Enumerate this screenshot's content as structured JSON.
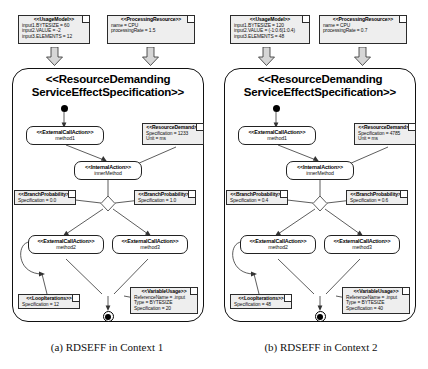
{
  "figure": {
    "captions": {
      "left": "(a) RDSEFF in Context 1",
      "right": "(b) RDSEFF in Context 2"
    }
  },
  "icons": {
    "down_arrow": "down-arrow-icon",
    "note_fold": "note-fold-icon",
    "start_node": "start-node-icon",
    "stop_node": "stop-node-icon",
    "decision_diamond": "decision-diamond-icon"
  },
  "panels": [
    {
      "id": "context-1",
      "usage_model": {
        "stereotype": "<<UsageModel>>",
        "lines": [
          "input1.BYTESIZE = 60",
          "input2.VALUE = -2",
          "input3.ELEMENTS = 12"
        ]
      },
      "processing_resource": {
        "stereotype": "<<ProcessingResource>>",
        "lines": [
          "name = CPU",
          "processingRate = 1.5"
        ]
      },
      "rdseff": {
        "title_line1": "<<ResourceDemanding",
        "title_line2": "ServiceEffectSpecification>>"
      },
      "nodes": {
        "external_call_1": {
          "stereotype": "<<ExternalCallAction>>",
          "name": "method1"
        },
        "internal_action": {
          "stereotype": "<<InternalAction>>",
          "name": "innerMethod"
        },
        "external_call_2": {
          "stereotype": "<<ExternalCallAction>>",
          "name": "method2"
        },
        "external_call_3": {
          "stereotype": "<<ExternalCallAction>>",
          "name": "method3"
        }
      },
      "resource_demand": {
        "stereotype": "<<ResourceDemand>>",
        "lines": [
          "Specification = 1233",
          "Unit = ms"
        ]
      },
      "branch_probability_left": {
        "stereotype": "<<BranchProbability>>",
        "lines": [
          "Specification = 0.0"
        ]
      },
      "branch_probability_right": {
        "stereotype": "<<BranchProbability>>",
        "lines": [
          "Specification = 1.0"
        ]
      },
      "loop_iterations": {
        "stereotype": "<<LoopIterations>>",
        "lines": [
          "Specification = 12"
        ]
      },
      "variable_usage": {
        "stereotype": "<<VariableUsage>>",
        "lines": [
          "ReferenceName = .input",
          "Type = BYTESIZE",
          "Specification = 20"
        ]
      }
    },
    {
      "id": "context-2",
      "usage_model": {
        "stereotype": "<<UsageModel>>",
        "lines": [
          "input1.BYTESIZE = 120",
          "input2.VALUE = (-1:0.6|1:0.4)",
          "input3.ELEMENTS = 48"
        ]
      },
      "processing_resource": {
        "stereotype": "<<ProcessingResource>>",
        "lines": [
          "name = CPU",
          "processingRate = 0.7"
        ]
      },
      "rdseff": {
        "title_line1": "<<ResourceDemanding",
        "title_line2": "ServiceEffectSpecification>>"
      },
      "nodes": {
        "external_call_1": {
          "stereotype": "<<ExternalCallAction>>",
          "name": "method1"
        },
        "internal_action": {
          "stereotype": "<<InternalAction>>",
          "name": "innerMethod"
        },
        "external_call_2": {
          "stereotype": "<<ExternalCallAction>>",
          "name": "method2"
        },
        "external_call_3": {
          "stereotype": "<<ExternalCallAction>>",
          "name": "method3"
        }
      },
      "resource_demand": {
        "stereotype": "<<ResourceDemand>>",
        "lines": [
          "Specification = 4785",
          "Unit = ms"
        ]
      },
      "branch_probability_left": {
        "stereotype": "<<BranchProbability>>",
        "lines": [
          "Specification = 0.4"
        ]
      },
      "branch_probability_right": {
        "stereotype": "<<BranchProbability>>",
        "lines": [
          "Specification = 0.6"
        ]
      },
      "loop_iterations": {
        "stereotype": "<<LoopIterations>>",
        "lines": [
          "Specification = 48"
        ]
      },
      "variable_usage": {
        "stereotype": "<<VariableUsage>>",
        "lines": [
          "ReferenceName = .input",
          "Type = BYTESIZE",
          "Specification = 40"
        ]
      }
    }
  ]
}
